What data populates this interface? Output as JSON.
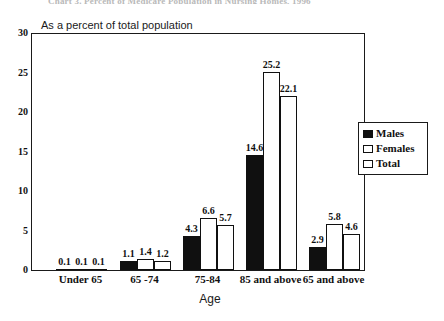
{
  "figure": {
    "title": "Chart 3. Percent of Medicare Population in Nursing Homes, 1996",
    "subtitle": "As a percent of total population",
    "xlabel": "Age"
  },
  "legend": {
    "items": [
      {
        "label": "Males",
        "swatch": "filled-black-swatch"
      },
      {
        "label": "Females",
        "swatch": "white-swatch"
      },
      {
        "label": "Total",
        "swatch": "white-swatch"
      }
    ]
  },
  "yaxis": {
    "ticks": [
      "30",
      "25",
      "20",
      "15",
      "10",
      "5",
      "0"
    ]
  },
  "chart_data": {
    "type": "bar",
    "title": "Chart 3. Percent of Medicare Population in Nursing Homes, 1996",
    "subtitle": "As a percent of total population",
    "xlabel": "Age",
    "ylabel": "",
    "ylim": [
      0,
      30
    ],
    "ytick_step": 5,
    "grid": false,
    "legend_position": "right",
    "categories": [
      "Under 65",
      "65 -74",
      "75-84",
      "85 and above",
      "65 and above"
    ],
    "series": [
      {
        "name": "Males",
        "color": "#101010",
        "values": [
          0.1,
          1.1,
          4.3,
          14.6,
          2.9
        ]
      },
      {
        "name": "Females",
        "color": "#ffffff",
        "values": [
          0.1,
          1.4,
          6.6,
          25.2,
          5.8
        ]
      },
      {
        "name": "Total",
        "color": "#ffffff",
        "values": [
          0.1,
          1.2,
          5.7,
          22.1,
          4.6
        ]
      }
    ],
    "data_labels": [
      [
        "0.1",
        "0.1",
        "0.1"
      ],
      [
        "1.1",
        "1.4",
        "1.2"
      ],
      [
        "4.3",
        "6.6",
        "5.7"
      ],
      [
        "14.6",
        "25.2",
        "22.1"
      ],
      [
        "2.9",
        "5.8",
        "4.6"
      ]
    ]
  }
}
